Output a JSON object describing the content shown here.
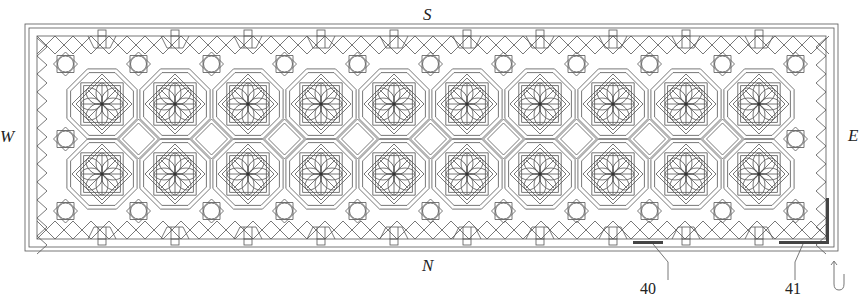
{
  "figure": {
    "type": "patent-drawing",
    "line_color": "#555555",
    "accent_color": "#444444",
    "frame": {
      "x": 25,
      "y": 24,
      "width": 813,
      "height": 227
    },
    "grid": {
      "columns": 10,
      "rows": 2,
      "start_x": 102,
      "pitch_x": 73,
      "row_y": [
        104,
        174
      ],
      "diamond_y": 139
    }
  },
  "orientation": {
    "north": "N",
    "south": "S",
    "east": "E",
    "west": "W"
  },
  "reference_numerals": [
    {
      "label": "40",
      "x": 651,
      "y": 287
    },
    {
      "label": "41",
      "x": 795,
      "y": 287
    }
  ],
  "direction_arrow": {
    "icon": "u-turn-arrow-icon"
  }
}
